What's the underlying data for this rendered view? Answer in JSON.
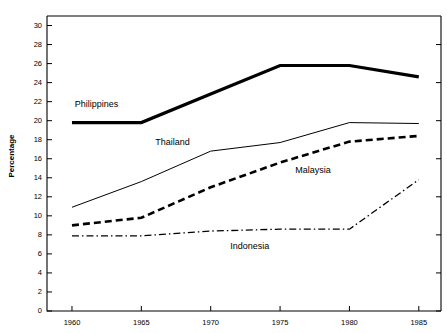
{
  "chart_data": {
    "type": "line",
    "title": "",
    "xlabel": "",
    "ylabel": "Percentage",
    "x": [
      1960,
      1965,
      1970,
      1975,
      1980,
      1985
    ],
    "xtick_labels": [
      "1960",
      "1965",
      "1970",
      "1975",
      "1980",
      "1985"
    ],
    "ytick_labels": [
      "0",
      "2",
      "4",
      "6",
      "8",
      "10",
      "12",
      "14",
      "16",
      "18",
      "20",
      "22",
      "24",
      "26",
      "28",
      "30"
    ],
    "ytick_values": [
      0,
      2,
      4,
      6,
      8,
      10,
      12,
      14,
      16,
      18,
      20,
      22,
      24,
      26,
      28,
      30
    ],
    "ylim": [
      0,
      31
    ],
    "xlim": [
      1958.2,
      1986.6
    ],
    "grid": false,
    "legend_position": "inline-annotations",
    "series": [
      {
        "name": "Philippines",
        "style": "thick-solid",
        "color": "#000000",
        "values": [
          19.8,
          19.8,
          22.8,
          25.8,
          25.8,
          24.6
        ],
        "label": "Philippines",
        "label_x": 1960.2,
        "label_y": 21.4
      },
      {
        "name": "Thailand",
        "style": "thin-solid",
        "color": "#000000",
        "values": [
          10.9,
          13.6,
          16.8,
          17.7,
          19.8,
          19.7
        ],
        "label": "Thailand",
        "label_x": 1966.0,
        "label_y": 17.4
      },
      {
        "name": "Malaysia",
        "style": "bold-dashed",
        "color": "#000000",
        "values": [
          9.0,
          9.8,
          13.0,
          15.6,
          17.8,
          18.4
        ],
        "label": "Malaysia",
        "label_x": 1976.1,
        "label_y": 14.5
      },
      {
        "name": "Indonesia",
        "style": "dash-dot",
        "color": "#000000",
        "values": [
          7.9,
          7.9,
          8.4,
          8.6,
          8.6,
          13.8
        ],
        "label": "Indonesia",
        "label_x": 1971.4,
        "label_y": 6.5
      }
    ]
  }
}
